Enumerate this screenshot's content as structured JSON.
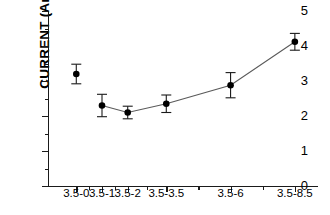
{
  "chart_data": {
    "type": "line",
    "title": "",
    "xlabel": "",
    "ylabel": "CURRENT (Amp)",
    "categories": [
      "3.5-0",
      "3.5-1",
      "3.5-2",
      "3.5-3.5",
      "3.5-6",
      "3.5-8.5"
    ],
    "x_positions": [
      0,
      1,
      2,
      3.5,
      6,
      8.5
    ],
    "values": [
      3.2,
      2.3,
      2.1,
      2.35,
      2.88,
      4.12
    ],
    "errors": [
      0.28,
      0.32,
      0.18,
      0.25,
      0.36,
      0.24
    ],
    "connected_from_index": 1,
    "ylim": [
      0,
      5
    ],
    "xlim": [
      -1.1,
      9.4
    ],
    "y_ticks": [
      0,
      1,
      2,
      3,
      4,
      5
    ],
    "y_tick_labels": [
      "0",
      "1",
      "2",
      "3",
      "4",
      "5"
    ],
    "y_minor_ticks": [
      0.5,
      1.5,
      2.5,
      3.5,
      4.5
    ],
    "grid": false,
    "legend": "none",
    "marker": "filled-circle",
    "marker_color": "#000000",
    "line_color": "#5a5a5a"
  }
}
